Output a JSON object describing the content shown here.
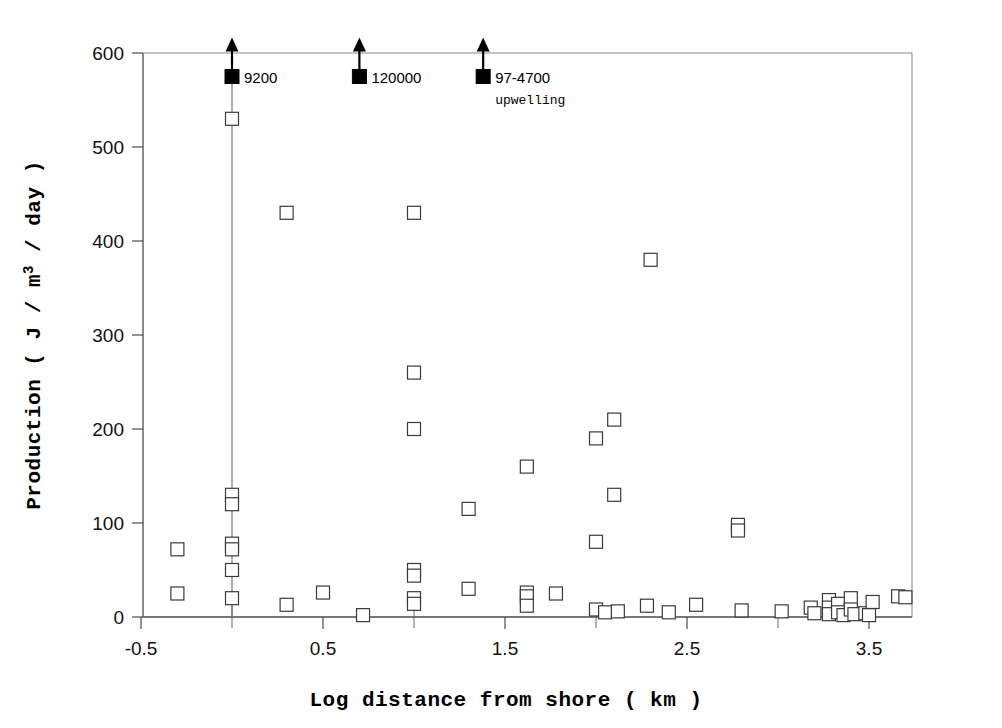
{
  "chart_data": {
    "type": "scatter",
    "title": "",
    "xlabel": "Log distance from shore ( km )",
    "ylabel": "Production ( J / m3 / day )",
    "ylabel_main": "Production ( J / m",
    "ylabel_sup": "3",
    "ylabel_tail": " / day )",
    "xlim": [
      -0.75,
      3.85
    ],
    "ylim": [
      0,
      600
    ],
    "grid": false,
    "legend": "none",
    "xticks": [
      -0.5,
      0.5,
      1.5,
      2.5,
      3.5
    ],
    "xtick_labels": [
      "-0.5",
      "0.5",
      "1.5",
      "2.5",
      "3.5"
    ],
    "xticks_minor": [
      0.0,
      1.0,
      2.0,
      3.0
    ],
    "yticks": [
      0,
      100,
      200,
      300,
      400,
      500,
      600
    ],
    "ytick_labels": [
      "0",
      "100",
      "200",
      "300",
      "400",
      "500",
      "600"
    ],
    "marker_style": "open-square",
    "points": [
      {
        "x": -0.3,
        "y": 72
      },
      {
        "x": -0.3,
        "y": 25
      },
      {
        "x": 0.0,
        "y": 530
      },
      {
        "x": 0.0,
        "y": 130
      },
      {
        "x": 0.0,
        "y": 120
      },
      {
        "x": 0.0,
        "y": 78
      },
      {
        "x": 0.0,
        "y": 72
      },
      {
        "x": 0.0,
        "y": 50
      },
      {
        "x": 0.0,
        "y": 20
      },
      {
        "x": 0.3,
        "y": 430
      },
      {
        "x": 0.3,
        "y": 13
      },
      {
        "x": 0.5,
        "y": 26
      },
      {
        "x": 0.72,
        "y": 2
      },
      {
        "x": 1.0,
        "y": 430
      },
      {
        "x": 1.0,
        "y": 260
      },
      {
        "x": 1.0,
        "y": 200
      },
      {
        "x": 1.0,
        "y": 50
      },
      {
        "x": 1.0,
        "y": 44
      },
      {
        "x": 1.0,
        "y": 20
      },
      {
        "x": 1.0,
        "y": 14
      },
      {
        "x": 1.3,
        "y": 115
      },
      {
        "x": 1.3,
        "y": 30
      },
      {
        "x": 1.62,
        "y": 160
      },
      {
        "x": 1.62,
        "y": 26
      },
      {
        "x": 1.62,
        "y": 22
      },
      {
        "x": 1.62,
        "y": 12
      },
      {
        "x": 1.78,
        "y": 25
      },
      {
        "x": 2.0,
        "y": 190
      },
      {
        "x": 2.0,
        "y": 80
      },
      {
        "x": 2.0,
        "y": 8
      },
      {
        "x": 2.05,
        "y": 5
      },
      {
        "x": 2.1,
        "y": 210
      },
      {
        "x": 2.1,
        "y": 130
      },
      {
        "x": 2.12,
        "y": 6
      },
      {
        "x": 2.28,
        "y": 12
      },
      {
        "x": 2.3,
        "y": 380
      },
      {
        "x": 2.4,
        "y": 5
      },
      {
        "x": 2.55,
        "y": 13
      },
      {
        "x": 2.78,
        "y": 98
      },
      {
        "x": 2.78,
        "y": 92
      },
      {
        "x": 2.8,
        "y": 7
      },
      {
        "x": 3.02,
        "y": 6
      },
      {
        "x": 3.18,
        "y": 10
      },
      {
        "x": 3.2,
        "y": 4
      },
      {
        "x": 3.28,
        "y": 18
      },
      {
        "x": 3.28,
        "y": 10
      },
      {
        "x": 3.28,
        "y": 3
      },
      {
        "x": 3.33,
        "y": 14
      },
      {
        "x": 3.33,
        "y": 5
      },
      {
        "x": 3.36,
        "y": 2
      },
      {
        "x": 3.4,
        "y": 20
      },
      {
        "x": 3.4,
        "y": 8
      },
      {
        "x": 3.42,
        "y": 3
      },
      {
        "x": 3.48,
        "y": 4
      },
      {
        "x": 3.5,
        "y": 2
      },
      {
        "x": 3.52,
        "y": 16
      },
      {
        "x": 3.66,
        "y": 22
      },
      {
        "x": 3.7,
        "y": 21
      }
    ],
    "offscale_points": [
      {
        "x": 0.0,
        "y": 575,
        "label": "9200",
        "sublabel": ""
      },
      {
        "x": 0.7,
        "y": 575,
        "label": "120000",
        "sublabel": ""
      },
      {
        "x": 1.38,
        "y": 575,
        "label": "97-4700",
        "sublabel": "upwelling"
      }
    ],
    "vertical_line": {
      "x": 0.0,
      "y_from": 0,
      "y_to": 595
    },
    "colors": {
      "marker_edge": "#3a3a3a",
      "marker_face": "#ffffff",
      "offscale_marker": "#000000",
      "axis": "#4a4a4a",
      "text": "#111111",
      "background": "#ffffff"
    }
  }
}
